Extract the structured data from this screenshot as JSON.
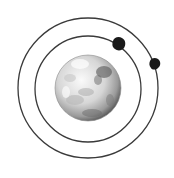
{
  "diagram": {
    "title": "Planet with two moons on concentric orbits",
    "colors": {
      "background": "#ffffff",
      "orbit": "#3a3a3a",
      "moon": "#1a1a1a",
      "planet_light": "#f2f2f2",
      "planet_mid": "#bdbdbd",
      "planet_dark": "#4a4a4a"
    },
    "planet": {
      "label": "Planet",
      "cx": 88,
      "cy": 88,
      "r": 33
    },
    "orbits": [
      {
        "label": "Inner orbit",
        "cx": 88,
        "cy": 89,
        "r": 53
      },
      {
        "label": "Outer orbit",
        "cx": 88,
        "cy": 88,
        "r": 70
      }
    ],
    "moons": [
      {
        "label": "Inner moon",
        "cx": 119,
        "cy": 44,
        "r": 6.5
      },
      {
        "label": "Outer moon",
        "cx": 155,
        "cy": 64,
        "r": 5.5
      }
    ]
  }
}
